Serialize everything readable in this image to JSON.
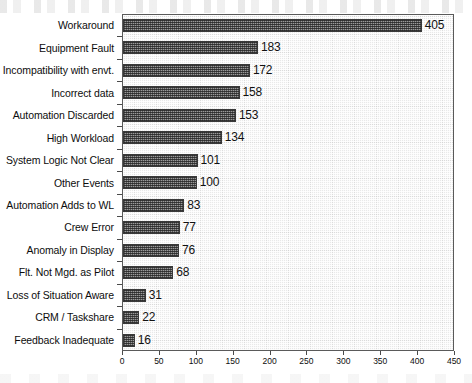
{
  "chart_data": {
    "type": "bar",
    "orientation": "horizontal",
    "title": "",
    "subtitle": "",
    "xlabel": "",
    "ylabel": "",
    "xlim": [
      0,
      450
    ],
    "xticks": [
      0,
      50,
      100,
      150,
      200,
      250,
      300,
      350,
      400,
      450
    ],
    "grid": false,
    "legend": null,
    "categories": [
      "Workaround",
      "Equipment Fault",
      "Incompatibility with envt.",
      "Incorrect data",
      "Automation Discarded",
      "High Workload",
      "System Logic Not Clear",
      "Other Events",
      "Automation Adds to WL",
      "Crew Error",
      "Anomaly in Display",
      "Flt. Not Mgd. as Pilot",
      "Loss of Situation Aware",
      "CRM / Taskshare",
      "Feedback Inadequate"
    ],
    "values": [
      405,
      183,
      172,
      158,
      153,
      134,
      101,
      100,
      83,
      77,
      76,
      68,
      31,
      22,
      16
    ],
    "data_labels": [
      "405",
      "183",
      "172",
      "158",
      "153",
      "134",
      "101",
      "100",
      "83",
      "77",
      "76",
      "68",
      "31",
      "22",
      "16"
    ],
    "xtick_labels": [
      "0",
      "50",
      "100",
      "150",
      "200",
      "250",
      "300",
      "350",
      "400",
      "450"
    ],
    "colors": {
      "bar_fill": "#9a9a9a",
      "bar_border": "#3a3a3a",
      "plot_background": "#e9e9e9",
      "axis": "#5a5a5a",
      "text": "#0d0d0d"
    }
  }
}
